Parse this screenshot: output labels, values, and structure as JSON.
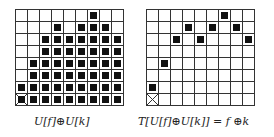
{
  "left_grid": {
    "columns": 9,
    "rows": 8,
    "filled_cells_by_row": [
      [
        7
      ],
      [
        4,
        6,
        7,
        8
      ],
      [
        3,
        4,
        5,
        6,
        7,
        8,
        9
      ],
      [
        3,
        4,
        5,
        6,
        7,
        8,
        9
      ],
      [
        2,
        3,
        4,
        5,
        6,
        7,
        8,
        9
      ],
      [
        2,
        3,
        4,
        5,
        6,
        7,
        8,
        9
      ],
      [
        1,
        2,
        3,
        4,
        5,
        6,
        7,
        8,
        9
      ],
      [
        1,
        2,
        3,
        4,
        5,
        6,
        7,
        8,
        9
      ]
    ],
    "crossed_cell": {
      "row": 8,
      "col": 1
    },
    "caption": "U[f]⊕U[k]"
  },
  "right_grid": {
    "columns": 9,
    "rows": 8,
    "filled_cells_by_row": [
      [
        7
      ],
      [
        4,
        6,
        8
      ],
      [
        3,
        5,
        9
      ],
      [],
      [
        2
      ],
      [],
      [
        1
      ],
      []
    ],
    "crossed_cell": {
      "row": 8,
      "col": 1
    },
    "caption": "T[U[f]⊕U[k]] = f ⊕k"
  }
}
